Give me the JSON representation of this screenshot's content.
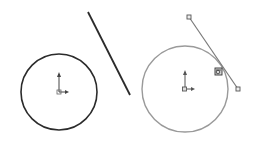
{
  "diagram": {
    "before": {
      "circle": {
        "cx": 59,
        "cy": 92,
        "r": 38,
        "stroke": "#2b2b2b"
      },
      "line": {
        "x1": 88,
        "y1": 12,
        "x2": 130,
        "y2": 95,
        "stroke": "#2b2b2b"
      }
    },
    "after": {
      "circle": {
        "cx": 185,
        "cy": 89,
        "r": 43,
        "stroke": "#9a9a9a"
      },
      "line": {
        "x1": 189,
        "y1": 17,
        "x2": 238,
        "y2": 89,
        "stroke": "#7a7a7a"
      },
      "tangent_marker": {
        "x": 218,
        "y": 71
      }
    },
    "colors": {
      "background": "#ffffff",
      "dark_stroke": "#2b2b2b",
      "light_stroke": "#9a9a9a"
    }
  }
}
